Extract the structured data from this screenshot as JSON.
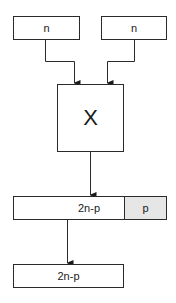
{
  "diagram": {
    "type": "block-diagram",
    "inputs": [
      {
        "label": "n"
      },
      {
        "label": "n"
      }
    ],
    "operator": {
      "label": "X"
    },
    "product": {
      "high_part": "2n-p",
      "low_part": "p",
      "low_part_fill": "#e6e6e6"
    },
    "output": {
      "label": "2n-p"
    },
    "colors": {
      "stroke": "#2a2a2a",
      "background": "#ffffff",
      "shaded": "#e6e6e6"
    }
  }
}
